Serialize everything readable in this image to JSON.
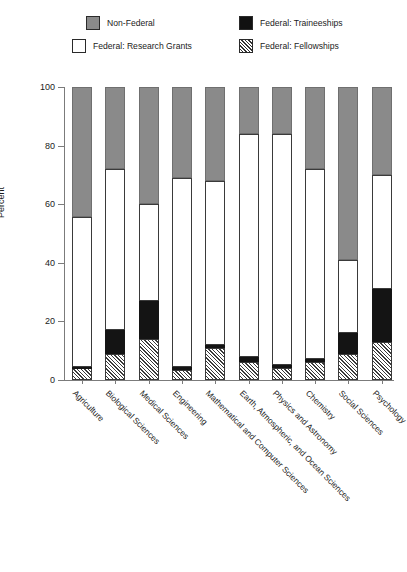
{
  "page_header": {
    "running_title": "",
    "page_number": ""
  },
  "legend": {
    "items": [
      {
        "label": "Non-Federal",
        "swatch": "gray-swatch-icon",
        "color": "#8a8a8a"
      },
      {
        "label": "Federal: Research Grants",
        "swatch": "white-swatch-icon",
        "color": "#ffffff"
      },
      {
        "label": "Federal: Traineeships",
        "swatch": "black-swatch-icon",
        "color": "#141414"
      },
      {
        "label": "Federal: Fellowships",
        "swatch": "hatched-swatch-icon",
        "color": "#ffffff"
      }
    ]
  },
  "chart_data": {
    "type": "bar",
    "subtype": "stacked-bar-100",
    "title": "",
    "xlabel": "",
    "ylabel": "Percent",
    "ylim": [
      0,
      100
    ],
    "yticks": [
      0,
      20,
      40,
      60,
      80,
      100
    ],
    "grid": false,
    "legend_position": "top",
    "categories": [
      "Agriculture",
      "Biological Sciences",
      "Medical Sciences",
      "Engineering",
      "Mathematical and Computer Sciences",
      "Earth, Atmospheric, and Ocean Sciences",
      "Physics and Astronomy",
      "Chemistry",
      "Social Sciences",
      "Psychology"
    ],
    "series": [
      {
        "name": "Federal: Fellowships",
        "style": "hatched",
        "values": [
          4,
          9,
          14,
          3.5,
          11,
          6,
          4,
          6,
          9,
          13
        ]
      },
      {
        "name": "Federal: Traineeships",
        "style": "black",
        "values": [
          0.5,
          8,
          13,
          1,
          1,
          2,
          1,
          1,
          7,
          18
        ]
      },
      {
        "name": "Federal: Research Grants",
        "style": "white",
        "values": [
          51,
          55,
          33,
          64.5,
          56,
          76,
          79,
          65,
          25,
          39
        ]
      },
      {
        "name": "Non-Federal",
        "style": "gray",
        "values": [
          44.5,
          28,
          40,
          31,
          32,
          16,
          16,
          28,
          59,
          30
        ]
      }
    ],
    "cumulative_tops": {
      "fellowships": [
        4,
        9,
        14,
        3.5,
        11,
        6,
        4,
        6,
        9,
        13
      ],
      "traineeships": [
        4.5,
        17,
        27,
        4.5,
        12,
        8,
        5,
        7,
        16,
        31
      ],
      "research_grants": [
        55.5,
        72,
        60,
        69,
        68,
        84,
        84,
        72,
        41,
        70
      ],
      "non_federal": [
        100,
        100,
        100,
        100,
        100,
        100,
        100,
        100,
        100,
        100
      ]
    }
  }
}
